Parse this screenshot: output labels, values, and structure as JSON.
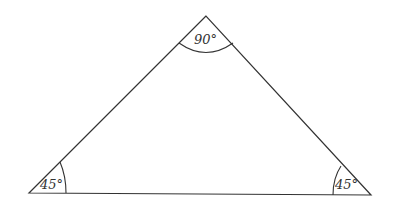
{
  "diagram": {
    "type": "triangle",
    "vertices": {
      "apex": {
        "x": 206,
        "y": 16
      },
      "left": {
        "x": 29,
        "y": 193
      },
      "right": {
        "x": 371,
        "y": 195
      }
    },
    "angles": {
      "apex": "90°",
      "left": "45°",
      "right": "45°"
    },
    "colors": {
      "line": "#333333",
      "background": "#ffffff"
    }
  }
}
